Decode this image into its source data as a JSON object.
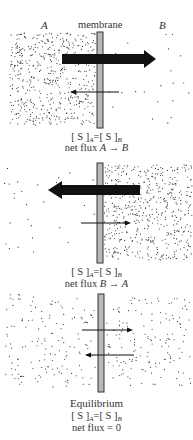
{
  "labels": {
    "side_a": "A",
    "side_b": "B",
    "membrane": "membrane"
  },
  "panels": [
    {
      "id": "panel-1",
      "concentration": {
        "left": "[ S ]",
        "sub_a": "A",
        "relation": "=",
        "right": "[ S ]",
        "sub_b": "B"
      },
      "flux_text": "net flux",
      "flux_dir": "A → B",
      "high_side": "A",
      "big_arrow": "right",
      "small_arrow": "left"
    },
    {
      "id": "panel-2",
      "concentration": {
        "left": "[ S ]",
        "sub_a": "A",
        "relation": "=",
        "right": "[ S ]",
        "sub_b": "B"
      },
      "flux_text": "net flux",
      "flux_dir": "B → A",
      "high_side": "B",
      "big_arrow": "left",
      "small_arrow": "right"
    },
    {
      "id": "panel-3",
      "title": "Equilibrium",
      "concentration": {
        "left": "[ S ]",
        "sub_a": "A",
        "relation": "=",
        "right": "[ S ]",
        "sub_b": "B"
      },
      "flux_text": "net flux = 0",
      "high_side": "none",
      "arrows": [
        "right",
        "left"
      ]
    }
  ],
  "colors": {
    "membrane_fill": "#b8b8b8",
    "membrane_edge": "#333333",
    "dot": "#2a2a2a",
    "arrow": "#111111"
  }
}
